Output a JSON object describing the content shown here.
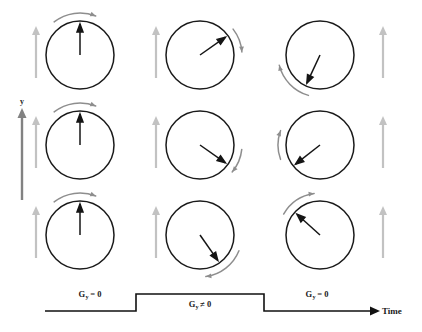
{
  "figure": {
    "background_color": "#ffffff"
  },
  "axes": {
    "y_axis": {
      "label": "y",
      "color": "#828282",
      "x": 22,
      "y_top": 108,
      "y_bottom": 200
    },
    "time_axis": {
      "label": "Time",
      "color": "#111111"
    }
  },
  "colors": {
    "circle_stroke": "#1a1a1a",
    "vector_stroke": "#151515",
    "arc_stroke": "#8e8e8e",
    "gradient_arrow": "#c2c2c2",
    "y_axis_arrow": "#828282",
    "waveform": "#111111"
  },
  "grid": {
    "columns": 3,
    "rows": 3,
    "column_x": [
      80,
      200,
      320
    ],
    "row_y": [
      55,
      145,
      235
    ],
    "radius": 34
  },
  "cells": [
    {
      "id": "cell-r1c1",
      "row": 1,
      "col": 1,
      "cx": 80,
      "cy": 55,
      "r": 34,
      "vector_angle_deg": 0,
      "vector_description": "phase vector pointing up (12 o'clock)",
      "arc_position": "top-right",
      "arc_start_deg": -38,
      "arc_end_deg": 22,
      "gradient_arrow": {
        "side": "left",
        "x": 36,
        "y_top": 26,
        "y_bottom": 78,
        "magnitude": "small"
      }
    },
    {
      "id": "cell-r1c2",
      "row": 1,
      "col": 2,
      "cx": 200,
      "cy": 55,
      "r": 34,
      "vector_angle_deg": 55,
      "vector_description": "phase vector rotated clockwise to upper right (1-2 o'clock)",
      "arc_position": "right",
      "arc_start_deg": 52,
      "arc_end_deg": 86,
      "gradient_arrow": {
        "side": "left",
        "x": 156,
        "y_top": 26,
        "y_bottom": 78,
        "magnitude": "small"
      }
    },
    {
      "id": "cell-r1c3",
      "row": 1,
      "col": 3,
      "cx": 320,
      "cy": 55,
      "r": 34,
      "vector_angle_deg": 205,
      "vector_description": "phase vector rotated far clockwise to lower left (7-8 o'clock)",
      "arc_position": "bottom-left",
      "arc_start_deg": 196,
      "arc_end_deg": 256,
      "gradient_arrow": {
        "side": "right",
        "x": 383,
        "y_top": 26,
        "y_bottom": 78,
        "magnitude": "small"
      }
    },
    {
      "id": "cell-r2c1",
      "row": 2,
      "col": 1,
      "cx": 80,
      "cy": 145,
      "r": 34,
      "vector_angle_deg": 0,
      "vector_description": "phase vector pointing up (12 o'clock)",
      "arc_position": "top-right",
      "arc_start_deg": -38,
      "arc_end_deg": 22,
      "gradient_arrow": {
        "side": "left",
        "x": 36,
        "y_top": 116,
        "y_bottom": 168,
        "magnitude": "small"
      }
    },
    {
      "id": "cell-r2c2",
      "row": 2,
      "col": 2,
      "cx": 200,
      "cy": 145,
      "r": 34,
      "vector_angle_deg": 125,
      "vector_description": "phase vector rotated clockwise to lower right (4-5 o'clock)",
      "arc_position": "right",
      "arc_start_deg": 96,
      "arc_end_deg": 130,
      "gradient_arrow": {
        "side": "left",
        "x": 156,
        "y_top": 116,
        "y_bottom": 168,
        "magnitude": "small"
      }
    },
    {
      "id": "cell-r2c3",
      "row": 2,
      "col": 3,
      "cx": 320,
      "cy": 145,
      "r": 34,
      "vector_angle_deg": 232,
      "vector_description": "phase vector rotated to lower left (7-8 o'clock)",
      "arc_position": "left",
      "arc_start_deg": 250,
      "arc_end_deg": 290,
      "gradient_arrow": {
        "side": "right",
        "x": 383,
        "y_top": 116,
        "y_bottom": 168,
        "magnitude": "small"
      }
    },
    {
      "id": "cell-r3c1",
      "row": 3,
      "col": 1,
      "cx": 80,
      "cy": 235,
      "r": 34,
      "vector_angle_deg": 0,
      "vector_description": "phase vector pointing up (12 o'clock)",
      "arc_position": "top-right",
      "arc_start_deg": -38,
      "arc_end_deg": 22,
      "gradient_arrow": {
        "side": "left",
        "x": 36,
        "y_top": 206,
        "y_bottom": 258,
        "magnitude": "small"
      }
    },
    {
      "id": "cell-r3c2",
      "row": 3,
      "col": 2,
      "cx": 200,
      "cy": 235,
      "r": 34,
      "vector_angle_deg": 145,
      "vector_description": "phase vector rotated clockwise to lower right (5 o'clock)",
      "arc_position": "bottom-right",
      "arc_start_deg": 112,
      "arc_end_deg": 172,
      "gradient_arrow": {
        "side": "left",
        "x": 156,
        "y_top": 206,
        "y_bottom": 258,
        "magnitude": "small"
      }
    },
    {
      "id": "cell-r3c3",
      "row": 3,
      "col": 3,
      "cx": 320,
      "cy": 235,
      "r": 34,
      "vector_angle_deg": 312,
      "vector_description": "phase vector rotated to upper left (10-11 o'clock)",
      "arc_position": "top-left",
      "arc_start_deg": 300,
      "arc_end_deg": 352,
      "gradient_arrow": {
        "side": "right",
        "x": 383,
        "y_top": 206,
        "y_bottom": 258,
        "magnitude": "small"
      }
    }
  ],
  "waveform": {
    "baseline_y": 311,
    "plateau_y": 294,
    "x_start": 45,
    "x_rise": 136,
    "x_fall": 264,
    "x_end": 372,
    "path": "M45,311 L136,311 L136,294 L264,294 L264,311 L372,311",
    "segments": [
      {
        "id": "segment-pre",
        "name": "gradient-off-before",
        "label_main": "G",
        "label_sub": "y",
        "label_rel": "= 0",
        "label_x": 90,
        "label_y": 297
      },
      {
        "id": "segment-on",
        "name": "gradient-on",
        "label_main": "G",
        "label_sub": "y",
        "label_rel": "≠ 0",
        "label_x": 200,
        "label_y": 307
      },
      {
        "id": "segment-post",
        "name": "gradient-off-after",
        "label_main": "G",
        "label_sub": "y",
        "label_rel": "= 0",
        "label_x": 317,
        "label_y": 297
      }
    ]
  }
}
